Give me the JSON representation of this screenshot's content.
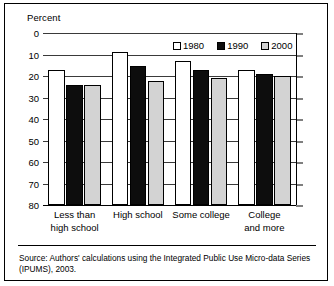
{
  "figure": {
    "axis_title": "Percent",
    "source_note": "Source: Authors' calculations using the Integrated Public Use Micro-data Series (IPUMS), 2003."
  },
  "legend": {
    "items": [
      {
        "label": "1980",
        "color": "#ffffff"
      },
      {
        "label": "1990",
        "color": "#0d0d0d"
      },
      {
        "label": "2000",
        "color": "#d3d3d3"
      }
    ]
  },
  "axis": {
    "yticks": [
      "80",
      "70",
      "60",
      "50",
      "40",
      "30",
      "20",
      "10",
      "0"
    ]
  },
  "categories": [
    {
      "line1": "Less than",
      "line2": "high school"
    },
    {
      "line1": "High school",
      "line2": ""
    },
    {
      "line1": "Some college",
      "line2": ""
    },
    {
      "line1": "College",
      "line2": "and more"
    }
  ],
  "chart_data": {
    "type": "bar",
    "title": "",
    "subtitle": "",
    "xlabel": "",
    "ylabel": "Percent",
    "ylim": [
      0,
      80
    ],
    "yticks": [
      0,
      10,
      20,
      30,
      40,
      50,
      60,
      70,
      80
    ],
    "grid": true,
    "legend_position": "top-right",
    "categories": [
      "Less than high school",
      "High school",
      "Some college",
      "College and more"
    ],
    "series": [
      {
        "name": "1980",
        "color": "#ffffff",
        "values": [
          63,
          71,
          67,
          63
        ]
      },
      {
        "name": "1990",
        "color": "#0d0d0d",
        "values": [
          56,
          64.5,
          63,
          61
        ]
      },
      {
        "name": "2000",
        "color": "#d3d3d3",
        "values": [
          56,
          57.5,
          59,
          60
        ]
      }
    ],
    "annotations": [
      "Source: Authors' calculations using the Integrated Public Use Micro-data Series (IPUMS), 2003."
    ]
  }
}
